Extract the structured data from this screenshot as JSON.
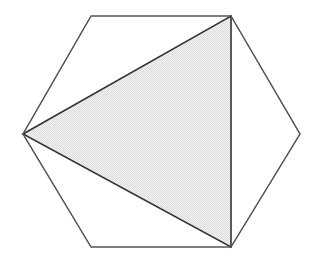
{
  "figure": {
    "canvas": {
      "width": 319,
      "height": 263,
      "background_color": "#ffffff"
    },
    "shapes": [
      {
        "id": "hexagon",
        "name": "outer-hexagon",
        "kind": "polygon",
        "sides": 6,
        "fill": "none",
        "fill_color": "#ffffff",
        "stroke_color": "#555555",
        "stroke_width": 1.2,
        "points": "23,134 91,16 231,16 300,134 231,247 91,247",
        "vertices": [
          {
            "label": "left",
            "x": 23,
            "y": 134
          },
          {
            "label": "top-left",
            "x": 91,
            "y": 16
          },
          {
            "label": "top-right",
            "x": 231,
            "y": 16
          },
          {
            "label": "right",
            "x": 300,
            "y": 134
          },
          {
            "label": "bottom-right",
            "x": 231,
            "y": 247
          },
          {
            "label": "bottom-left",
            "x": 91,
            "y": 247
          }
        ]
      },
      {
        "id": "triangle",
        "name": "inscribed-shaded-triangle",
        "kind": "polygon",
        "sides": 3,
        "fill": "shaded",
        "fill_color": "#e9e9e9",
        "stroke_color": "#333333",
        "stroke_width": 1.6,
        "points": "23,134 231,16 231,247",
        "vertices": [
          {
            "label": "left-apex",
            "x": 23,
            "y": 134
          },
          {
            "label": "top-right",
            "x": 231,
            "y": 16
          },
          {
            "label": "bottom-right",
            "x": 231,
            "y": 247
          }
        ]
      }
    ],
    "colors": {
      "background": "#ffffff",
      "hexagon_stroke": "#555555",
      "triangle_stroke": "#333333",
      "triangle_fill": "#e9e9e9",
      "triangle_fill_dither": "#d8d8d8"
    }
  }
}
